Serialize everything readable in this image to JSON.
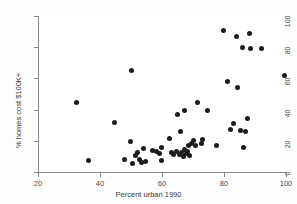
{
  "chart_data": {
    "type": "scatter",
    "title": "",
    "xlabel": "Percent urban 1990",
    "ylabel": "% homes cost $100K+",
    "xlim": [
      20,
      100
    ],
    "ylim": [
      0,
      100
    ],
    "xticks": [
      20,
      40,
      60,
      80,
      100
    ],
    "yticks": [
      0,
      20,
      40,
      60,
      80,
      100
    ],
    "grid": false,
    "legend": null,
    "marker": {
      "shape": "circle",
      "color": "#1c1c1c",
      "size": 5
    },
    "points": [
      {
        "x": 32.3,
        "y": 44.5
      },
      {
        "x": 36.4,
        "y": 7.2
      },
      {
        "x": 44.8,
        "y": 32.0
      },
      {
        "x": 47.9,
        "y": 8.0
      },
      {
        "x": 49.8,
        "y": 19.3
      },
      {
        "x": 50.2,
        "y": 65.3
      },
      {
        "x": 50.6,
        "y": 5.3
      },
      {
        "x": 51.4,
        "y": 10.3
      },
      {
        "x": 52.2,
        "y": 12.8
      },
      {
        "x": 52.7,
        "y": 8.2
      },
      {
        "x": 53.3,
        "y": 6.3
      },
      {
        "x": 54.0,
        "y": 15.0
      },
      {
        "x": 54.6,
        "y": 7.0
      },
      {
        "x": 57.0,
        "y": 13.9
      },
      {
        "x": 58.3,
        "y": 13.0
      },
      {
        "x": 59.3,
        "y": 12.1
      },
      {
        "x": 59.7,
        "y": 7.3
      },
      {
        "x": 59.9,
        "y": 16.0
      },
      {
        "x": 62.3,
        "y": 21.6
      },
      {
        "x": 63.1,
        "y": 12.3
      },
      {
        "x": 63.6,
        "y": 11.5
      },
      {
        "x": 64.6,
        "y": 13.2
      },
      {
        "x": 64.9,
        "y": 37.0
      },
      {
        "x": 65.5,
        "y": 11.1
      },
      {
        "x": 66.0,
        "y": 26.2
      },
      {
        "x": 66.3,
        "y": 12.5
      },
      {
        "x": 66.8,
        "y": 9.9
      },
      {
        "x": 67.1,
        "y": 14.4
      },
      {
        "x": 67.4,
        "y": 39.3
      },
      {
        "x": 67.8,
        "y": 11.8
      },
      {
        "x": 68.2,
        "y": 13.0
      },
      {
        "x": 68.6,
        "y": 17.0
      },
      {
        "x": 69.0,
        "y": 10.6
      },
      {
        "x": 69.4,
        "y": 18.2
      },
      {
        "x": 70.2,
        "y": 20.4
      },
      {
        "x": 70.9,
        "y": 17.3
      },
      {
        "x": 71.6,
        "y": 44.6
      },
      {
        "x": 72.6,
        "y": 18.4
      },
      {
        "x": 73.2,
        "y": 21.0
      },
      {
        "x": 74.6,
        "y": 39.2
      },
      {
        "x": 77.5,
        "y": 17.2
      },
      {
        "x": 79.8,
        "y": 91.0
      },
      {
        "x": 81.2,
        "y": 57.7
      },
      {
        "x": 82.0,
        "y": 27.5
      },
      {
        "x": 83.0,
        "y": 31.2
      },
      {
        "x": 84.0,
        "y": 87.0
      },
      {
        "x": 84.3,
        "y": 54.0
      },
      {
        "x": 85.3,
        "y": 26.8
      },
      {
        "x": 86.0,
        "y": 79.5
      },
      {
        "x": 86.4,
        "y": 15.8
      },
      {
        "x": 87.0,
        "y": 26.0
      },
      {
        "x": 87.6,
        "y": 34.4
      },
      {
        "x": 88.1,
        "y": 89.0
      },
      {
        "x": 88.5,
        "y": 79.0
      },
      {
        "x": 92.0,
        "y": 78.9
      },
      {
        "x": 99.5,
        "y": 61.8
      }
    ]
  },
  "axes": {
    "x_tick_labels": [
      "20",
      "40",
      "60",
      "80",
      "100"
    ],
    "y_tick_labels": [
      "0",
      "20",
      "40",
      "60",
      "80",
      "100"
    ],
    "x_axis_title": "Percent urban 1990",
    "y_axis_title": "% homes cost $100K+"
  }
}
